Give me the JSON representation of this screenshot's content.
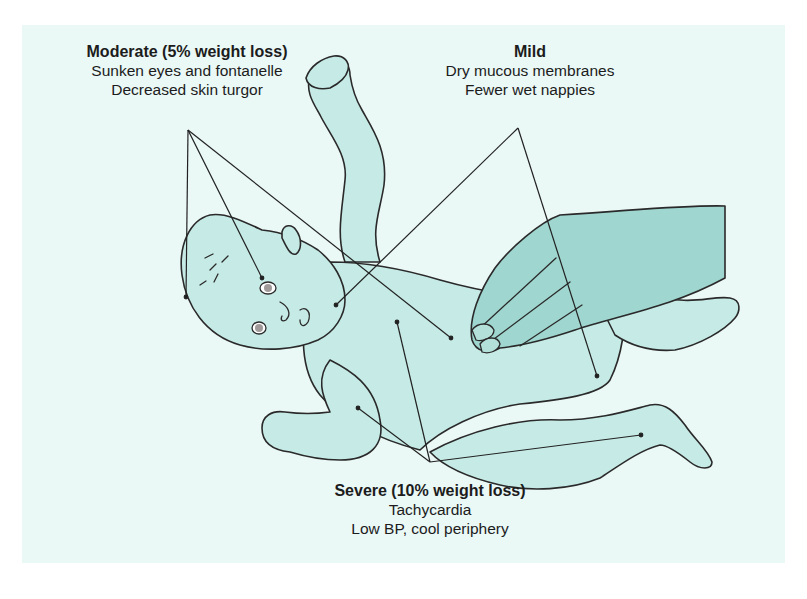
{
  "diagram": {
    "background_color": "#eaf8f6",
    "skin_color": "#c6ebe6",
    "hand_color": "#9fd6cf",
    "line_color": "#222222",
    "labels": {
      "moderate": {
        "title": "Moderate (5% weight loss)",
        "lines": [
          "Sunken eyes and fontanelle",
          "Decreased skin turgor"
        ]
      },
      "mild": {
        "title": "Mild",
        "lines": [
          "Dry mucous membranes",
          "Fewer wet nappies"
        ]
      },
      "severe": {
        "title": "Severe (10% weight loss)",
        "lines": [
          "Tachycardia",
          "Low BP, cool periphery"
        ]
      }
    },
    "leader_lines": {
      "moderate": {
        "origin": [
          188,
          130
        ],
        "targets": [
          [
            186,
            297
          ],
          [
            262,
            278
          ],
          [
            451,
            338
          ]
        ]
      },
      "mild": {
        "origin": [
          518,
          128
        ],
        "targets": [
          [
            336,
            305
          ],
          [
            597,
            376
          ]
        ]
      },
      "severe": {
        "origin": [
          430,
          462
        ],
        "targets": [
          [
            397,
            322
          ],
          [
            358,
            408
          ],
          [
            641,
            435
          ]
        ]
      }
    }
  }
}
